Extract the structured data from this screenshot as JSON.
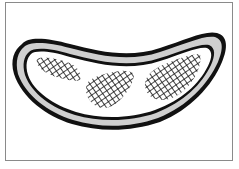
{
  "figure": {
    "colors": {
      "background": "#ffffff",
      "frame": "#8a8a8a",
      "outline": "#111111",
      "band": "#cfcfcf",
      "hatch": "#111111"
    },
    "patches": [
      {
        "name": "left-hatch-patch"
      },
      {
        "name": "middle-hatch-patch"
      },
      {
        "name": "right-hatch-patch"
      }
    ]
  }
}
